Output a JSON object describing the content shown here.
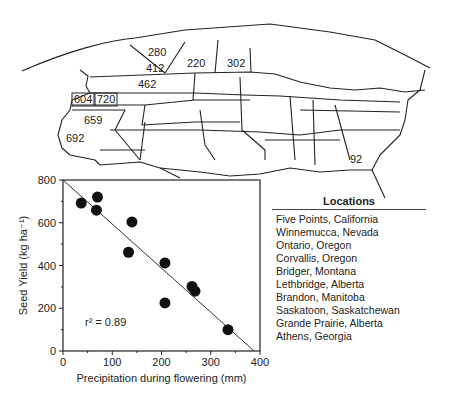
{
  "map": {
    "labels": [
      {
        "text": "280",
        "x": 148,
        "y": 56
      },
      {
        "text": "412",
        "x": 146,
        "y": 72
      },
      {
        "text": "220",
        "x": 187,
        "y": 67
      },
      {
        "text": "302",
        "x": 227,
        "y": 67
      },
      {
        "text": "462",
        "x": 138,
        "y": 88
      },
      {
        "text": "604",
        "x": 74,
        "y": 103,
        "boxed": true
      },
      {
        "text": "720",
        "x": 97,
        "y": 103,
        "boxed": true
      },
      {
        "text": "659",
        "x": 84,
        "y": 124
      },
      {
        "text": "692",
        "x": 66,
        "y": 142
      },
      {
        "text": "92",
        "x": 350,
        "y": 163
      }
    ]
  },
  "legend": {
    "title": "Locations",
    "items": [
      "Five Points, California",
      "Winnemucca, Nevada",
      "Ontario, Oregon",
      "Corvallis, Oregon",
      "Bridger, Montana",
      "Lethbridge, Alberta",
      "Brandon, Manitoba",
      "Saskatoon, Saskatchewan",
      "Grande Prairie, Alberta",
      "Athens, Georgia"
    ]
  },
  "chart_data": {
    "type": "scatter",
    "title": "",
    "xlabel": "Precipitation during flowering (mm)",
    "ylabel": "Seed Yield (kg ha⁻¹)",
    "xlim": [
      0,
      400
    ],
    "ylim": [
      0,
      800
    ],
    "xticks": [
      0,
      100,
      200,
      300,
      400
    ],
    "yticks": [
      0,
      200,
      400,
      600,
      800
    ],
    "grid": false,
    "points": [
      {
        "x": 37,
        "y": 692
      },
      {
        "x": 70,
        "y": 720
      },
      {
        "x": 68,
        "y": 659
      },
      {
        "x": 140,
        "y": 604
      },
      {
        "x": 133,
        "y": 462
      },
      {
        "x": 207,
        "y": 412
      },
      {
        "x": 207,
        "y": 225
      },
      {
        "x": 262,
        "y": 302
      },
      {
        "x": 268,
        "y": 280
      },
      {
        "x": 335,
        "y": 100
      }
    ],
    "regression_line": {
      "x0": 0,
      "y0": 800,
      "x1": 388,
      "y1": 0
    },
    "annotation": "r² = 0.89"
  }
}
